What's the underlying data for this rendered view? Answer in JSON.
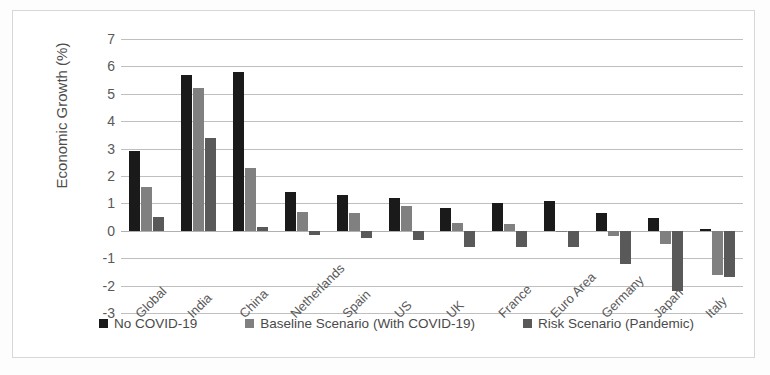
{
  "chart_data": {
    "type": "bar",
    "title": "",
    "xlabel": "",
    "ylabel": "Economic Growth (%)",
    "ylim": [
      -3,
      7
    ],
    "ytick_step": 1,
    "yticks": [
      7,
      6,
      5,
      4,
      3,
      2,
      1,
      0,
      -1,
      -2,
      -3
    ],
    "ytick_labels": [
      "7",
      "6",
      "5",
      "4",
      "3",
      "2",
      "1",
      "0",
      "-1",
      "-2",
      "-3"
    ],
    "grid": true,
    "legend_position": "bottom",
    "categories": [
      "Global",
      "India",
      "China",
      "Netherlands",
      "Spain",
      "US",
      "UK",
      "France",
      "Euro Area",
      "Germany",
      "Japan",
      "Italy"
    ],
    "series": [
      {
        "name": "No COVID-19",
        "color": "#1a1a1a",
        "values": [
          2.9,
          5.7,
          5.8,
          1.4,
          1.3,
          1.2,
          0.85,
          1.0,
          1.1,
          0.65,
          0.45,
          0.05
        ]
      },
      {
        "name": "Baseline Scenario (With COVID-19)",
        "color": "#808080",
        "values": [
          1.6,
          5.2,
          2.3,
          0.7,
          0.65,
          0.9,
          0.3,
          0.25,
          -0.05,
          -0.2,
          -0.5,
          -1.6
        ]
      },
      {
        "name": "Risk Scenario (Pandemic)",
        "color": "#595959",
        "values": [
          0.5,
          3.4,
          0.15,
          -0.15,
          -0.25,
          -0.35,
          -0.6,
          -0.6,
          -0.6,
          -1.2,
          -2.2,
          -1.7
        ]
      }
    ]
  },
  "legend": {
    "items": [
      {
        "label": "No COVID-19"
      },
      {
        "label": "Baseline Scenario (With COVID-19)"
      },
      {
        "label": "Risk Scenario (Pandemic)"
      }
    ]
  }
}
